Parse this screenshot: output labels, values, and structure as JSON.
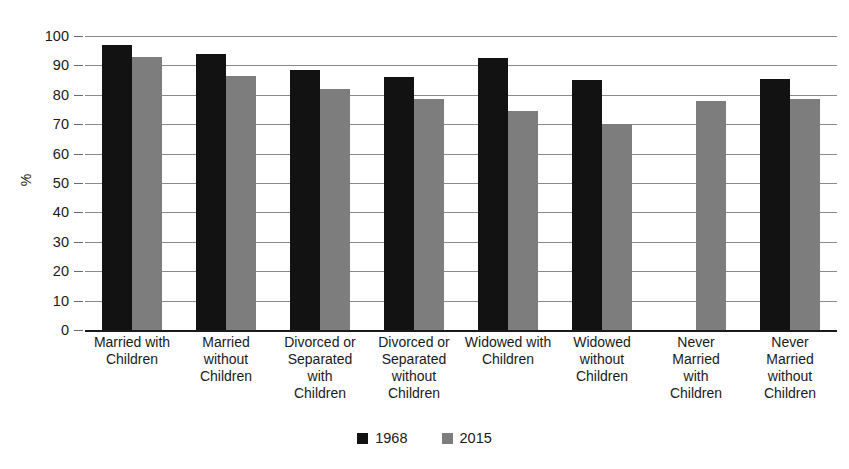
{
  "chart_data": {
    "type": "bar",
    "title": "",
    "xlabel": "",
    "ylabel": "%",
    "ylim": [
      0,
      100
    ],
    "ytick_step": 10,
    "grid": true,
    "legend_position": "bottom",
    "categories": [
      "Married with Children",
      "Married without Children",
      "Divorced or Separated with Children",
      "Divorced or Separated without Children",
      "Widowed with Children",
      "Widowed without Children",
      "Never Married with Children",
      "Never Married without Children"
    ],
    "category_lines": [
      [
        "Married with",
        "Children"
      ],
      [
        "Married",
        "without",
        "Children"
      ],
      [
        "Divorced or",
        "Separated",
        "with",
        "Children"
      ],
      [
        "Divorced or",
        "Separated",
        "without",
        "Children"
      ],
      [
        "Widowed with",
        "Children"
      ],
      [
        "Widowed",
        "without",
        "Children"
      ],
      [
        "Never",
        "Married",
        "with",
        "Children"
      ],
      [
        "Never",
        "Married",
        "without",
        "Children"
      ]
    ],
    "ytick_labels": [
      "100",
      "90",
      "80",
      "70",
      "60",
      "50",
      "40",
      "30",
      "20",
      "10",
      "0"
    ],
    "ytick_values": [
      100,
      90,
      80,
      70,
      60,
      50,
      40,
      30,
      20,
      10,
      0
    ],
    "series": [
      {
        "name": "1968",
        "color": "#121212",
        "values": [
          97,
          94,
          88.5,
          86,
          92.5,
          85,
          null,
          85.5
        ]
      },
      {
        "name": "2015",
        "color": "#7d7d7d",
        "values": [
          93,
          86.5,
          82,
          78.5,
          74.5,
          70,
          78,
          78.5
        ]
      }
    ]
  },
  "legend": {
    "items": [
      {
        "label": "1968",
        "color": "#121212"
      },
      {
        "label": "2015",
        "color": "#7d7d7d"
      }
    ]
  },
  "axis": {
    "y_title": "%"
  },
  "colors": {
    "series_1968": "#121212",
    "series_2015": "#7d7d7d",
    "gridline": "#8a8a8a",
    "baseline": "#1a1a1a",
    "background": "#ffffff"
  }
}
